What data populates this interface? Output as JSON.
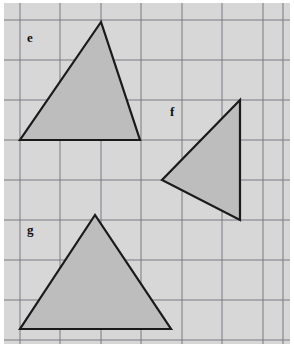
{
  "figure": {
    "width": 294,
    "height": 347,
    "page_background": "#ffffff",
    "panel_background": "#d7d7d7",
    "panel": {
      "x": 4,
      "y": 3,
      "width": 286,
      "height": 341
    }
  },
  "grid": {
    "line_color": "#7b7b82",
    "line_width": 1,
    "cell_size": 40,
    "x_lines": [
      20,
      60,
      101,
      141,
      182,
      222,
      263,
      283
    ],
    "y_lines": [
      20,
      60,
      100,
      140,
      180,
      220,
      260,
      300,
      340
    ]
  },
  "style": {
    "shape_fill": "#bdbdbd",
    "shape_stroke": "#1a1a1a",
    "shape_stroke_width": 2.2,
    "label_color": "#101010"
  },
  "shapes": [
    {
      "id": "triangle-e",
      "label": "e",
      "label_position": {
        "x": 27,
        "y": 31
      },
      "points": "101,22 20,140 140,140",
      "vertices": [
        {
          "x": 101,
          "y": 22
        },
        {
          "x": 20,
          "y": 140
        },
        {
          "x": 140,
          "y": 140
        }
      ]
    },
    {
      "id": "triangle-f",
      "label": "f",
      "label_position": {
        "x": 170,
        "y": 105
      },
      "points": "240,100 162,180 240,220",
      "vertices": [
        {
          "x": 240,
          "y": 100
        },
        {
          "x": 162,
          "y": 180
        },
        {
          "x": 240,
          "y": 220
        }
      ]
    },
    {
      "id": "triangle-g",
      "label": "g",
      "label_position": {
        "x": 27,
        "y": 223
      },
      "points": "95,215 20,329 171,329",
      "vertices": [
        {
          "x": 95,
          "y": 215
        },
        {
          "x": 20,
          "y": 329
        },
        {
          "x": 171,
          "y": 329
        }
      ]
    }
  ]
}
